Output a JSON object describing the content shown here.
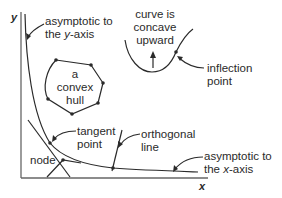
{
  "diagram": {
    "axes": {
      "x_label": "x",
      "y_label": "y"
    },
    "labels": {
      "asymptote_y": {
        "line1": "asymptotic to",
        "line2_pre": "the ",
        "line2_var": "y",
        "line2_post": "-axis"
      },
      "concave": {
        "line1": "curve is",
        "line2": "concave",
        "line3": "upward"
      },
      "inflection": {
        "line1": "inflection",
        "line2": "point"
      },
      "hull": {
        "line1": "a",
        "line2": "convex",
        "line3": "hull"
      },
      "tangent": {
        "line1": "tangent",
        "line2": "point"
      },
      "orthogonal": {
        "line1": "orthogonal",
        "line2": "line"
      },
      "node": {
        "text": "node"
      },
      "asymptote_x": {
        "line1": "asymptotic to",
        "line2_pre": "the ",
        "line2_var": "x",
        "line2_post": "-axis"
      }
    },
    "colors": {
      "stroke": "#2a2a2a",
      "background": "#ffffff"
    }
  }
}
